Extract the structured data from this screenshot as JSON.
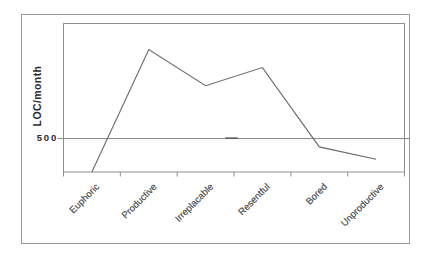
{
  "chart_data": {
    "type": "line",
    "categories": [
      "Euphoric",
      "Productive",
      "Irreplacable",
      "Resentful",
      "Bored",
      "Unproductive"
    ],
    "values": [
      0,
      1830,
      1290,
      1560,
      375,
      190
    ],
    "ylabel": "LOC/month",
    "xlabel": "",
    "ylim": [
      0,
      2220
    ],
    "yticks": [
      {
        "value": 500,
        "label": "500"
      }
    ],
    "reference_line_value": 500,
    "legend": "none",
    "grid": "single horizontal reference line at y=500",
    "x_label_rotation_deg": 45
  },
  "colors": {
    "background": "#ffffff",
    "outer_frame": "#9b9b9b",
    "plot_frame": "#8f8f8f",
    "reference_line": "#878787",
    "data_line": "#6a6a6a",
    "axis_text": "#2b2b2b",
    "category_text": "#55585a"
  }
}
